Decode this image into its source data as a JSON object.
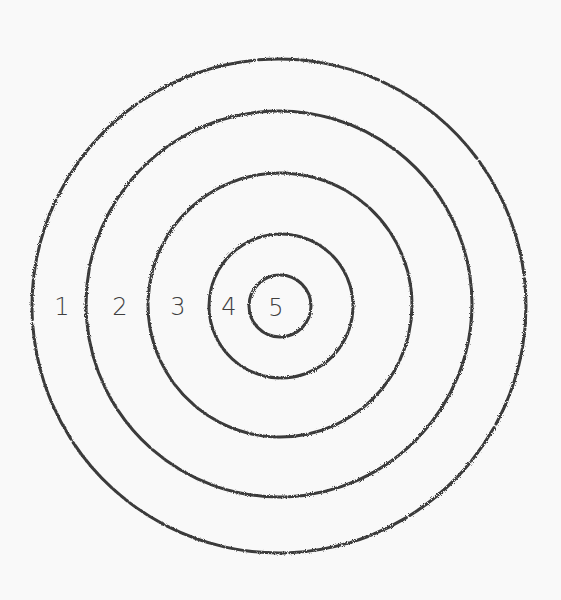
{
  "target": {
    "center": {
      "x": 279,
      "y": 306
    },
    "stroke_color": "#3a3a3a",
    "background": "#f9f9f9",
    "rings": [
      {
        "label": "1",
        "radius": 247,
        "label_x": 60
      },
      {
        "label": "2",
        "radius": 192,
        "label_x": 118
      },
      {
        "label": "3",
        "radius": 131,
        "label_x": 178
      },
      {
        "label": "4",
        "radius": 72,
        "label_x": 228
      },
      {
        "label": "5",
        "radius": 31,
        "label_x": 275
      }
    ]
  }
}
